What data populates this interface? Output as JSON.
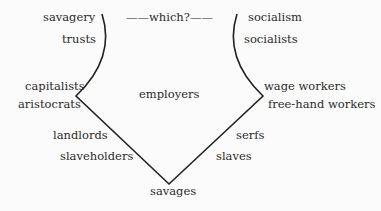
{
  "diagram": {
    "top_center": "——which?——",
    "left_labels": [
      "savagery",
      "trusts",
      "capitalists",
      "aristocrats",
      "landlords",
      "slaveholders"
    ],
    "center_label": "employers",
    "right_labels": [
      "socialism",
      "socialists",
      "wage workers",
      "free-hand workers",
      "serfs",
      "slaves"
    ],
    "bottom_label": "savages",
    "line_color": "#222222"
  }
}
